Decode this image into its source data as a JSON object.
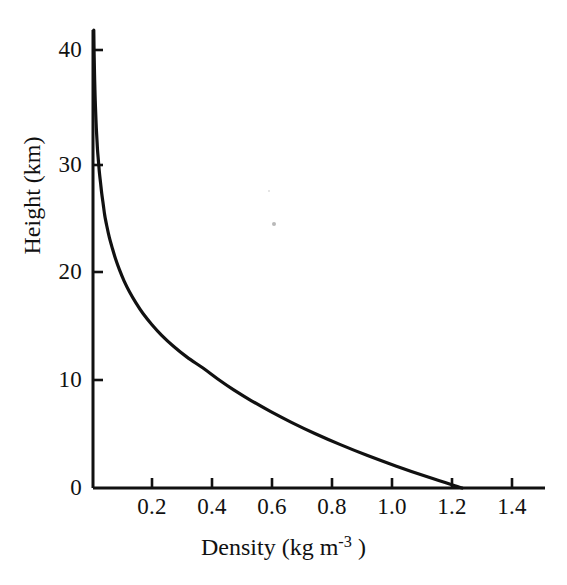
{
  "figure": {
    "background_color": "#ffffff",
    "ink_color": "#111111",
    "width": 567,
    "height": 585
  },
  "axes": {
    "x_title": "Density (kg m",
    "x_title_exponent": "-3",
    "x_title_tail": " )",
    "y_title": "Height (km)",
    "x_ticks": [
      "0.2",
      "0.4",
      "0.6",
      "0.8",
      "1.0",
      "1.2",
      "1.4"
    ],
    "y_ticks": [
      "40",
      "30",
      "20",
      "10",
      "0"
    ]
  },
  "chart_data": {
    "type": "line",
    "title": "",
    "subtitle": "",
    "xlabel": "Density (kg m-3 )",
    "ylabel": "Height (km)",
    "xlim": [
      0.0,
      1.5
    ],
    "ylim": [
      0,
      42
    ],
    "xticks": [
      0.2,
      0.4,
      0.6,
      0.8,
      1.0,
      1.2,
      1.4
    ],
    "yticks": [
      0,
      10,
      20,
      30,
      40
    ],
    "grid": false,
    "legend": false,
    "legend_position": "none",
    "annotations": [],
    "series": [
      {
        "name": "Atmospheric density profile",
        "x_name": "Density (kg m^-3)",
        "y_name": "Height (km)",
        "x": [
          1.225,
          1.112,
          1.007,
          0.909,
          0.819,
          0.736,
          0.66,
          0.59,
          0.526,
          0.467,
          0.414,
          0.365,
          0.312,
          0.267,
          0.228,
          0.195,
          0.166,
          0.142,
          0.121,
          0.103,
          0.088,
          0.075,
          0.064,
          0.054,
          0.046,
          0.039,
          0.034,
          0.029,
          0.025,
          0.021,
          0.018,
          0.015,
          0.013,
          0.011,
          0.0095,
          0.0081,
          0.0069,
          0.0059,
          0.005,
          0.0043,
          0.0036,
          0.0031,
          0.0026
        ],
        "y": [
          0,
          1,
          2,
          3,
          4,
          5,
          6,
          7,
          8,
          9,
          10,
          11,
          12,
          13,
          14,
          15,
          16,
          17,
          18,
          19,
          20,
          21,
          22,
          23,
          24,
          25,
          26,
          27,
          28,
          29,
          30,
          31,
          32,
          33,
          34,
          35,
          36,
          37,
          38,
          39,
          40,
          41,
          42
        ]
      }
    ]
  },
  "artifacts": {
    "speck_label": "scan-speck"
  }
}
